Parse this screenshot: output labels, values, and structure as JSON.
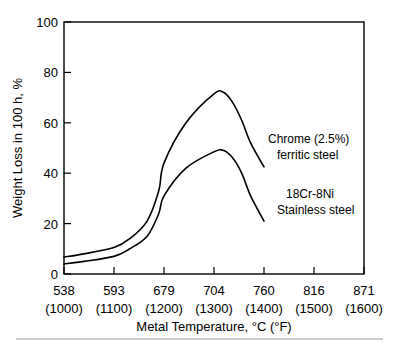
{
  "chart_data": {
    "type": "line",
    "title": "",
    "xlabel": "Metal Temperature, °C (°F)",
    "ylabel": "Weight Loss in 100 h, %",
    "xlim": [
      538,
      871
    ],
    "ylim": [
      0,
      100
    ],
    "grid": false,
    "legend_position": "inline-annotations",
    "x_tick_labels_c": [
      "538",
      "593",
      "679",
      "704",
      "760",
      "816",
      "871"
    ],
    "x_tick_labels_f": [
      "(1000)",
      "(1100)",
      "(1200)",
      "(1300)",
      "(1400)",
      "(1500)",
      "(1600)"
    ],
    "x_tick_values": [
      538,
      593,
      679,
      704,
      760,
      816,
      871
    ],
    "y_tick_labels": [
      "0",
      "20",
      "40",
      "60",
      "80",
      "100"
    ],
    "y_tick_values": [
      0,
      20,
      40,
      60,
      80,
      100
    ],
    "series": [
      {
        "name": "Chrome (2.5%) ferritic steel",
        "label_line1": "Chrome (2.5%)",
        "label_line2": "ferritic steel",
        "color": "#000000",
        "x": [
          538,
          560,
          593,
          620,
          650,
          670,
          679,
          690,
          704,
          715,
          725,
          735,
          745,
          760
        ],
        "values": [
          6.7,
          8.0,
          10.5,
          14.0,
          21.0,
          33.0,
          44.0,
          60.0,
          71.5,
          72.0,
          68.0,
          61.0,
          52.0,
          42.5
        ]
      },
      {
        "name": "18Cr-8Ni Stainless steel",
        "label_line1": "18Cr-8Ni",
        "label_line2": "Stainless steel",
        "color": "#000000",
        "x": [
          538,
          560,
          593,
          620,
          650,
          670,
          679,
          690,
          704,
          715,
          725,
          735,
          745,
          760
        ],
        "values": [
          4.0,
          5.0,
          7.0,
          10.0,
          15.0,
          24.0,
          31.0,
          42.0,
          48.5,
          49.0,
          46.0,
          40.0,
          31.0,
          21.0
        ]
      }
    ],
    "annotations": [
      {
        "text_line1": "Chrome (2.5%)",
        "text_line2": "ferritic steel"
      },
      {
        "text_line1": "18Cr-8Ni",
        "text_line2": "Stainless steel"
      }
    ]
  }
}
